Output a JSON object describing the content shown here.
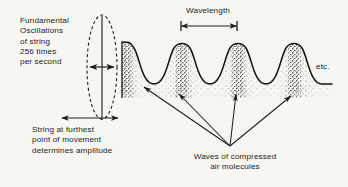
{
  "figure": {
    "background_color": "#f7f6f0",
    "ink_color": "#1d1d1b",
    "width": 348,
    "height": 187
  },
  "labels": {
    "fundamental": "Fundamental\nOscillations\nof string\n256 times\nper second",
    "amplitude": "String at furthest\npoint of movement\ndetermines amplitude",
    "wavelength": "Wavelength",
    "waves": "Waves of compressed\nair molecules",
    "etc": "etc."
  },
  "diagram": {
    "string_ellipse": {
      "name": "vibrating-string-envelope",
      "center_x": 102,
      "center_y": 67,
      "radius_x": 15,
      "radius_y": 52,
      "stroke_dash": "3,2.6"
    },
    "string_line": {
      "name": "string-rest-position",
      "x": 102,
      "y_top": 16,
      "y_bottom": 120
    },
    "amplitude_arrow": {
      "name": "amplitude-double-arrow",
      "x_start": 90,
      "x_end": 114,
      "y": 67
    },
    "wavelength_arrow": {
      "name": "wavelength-double-arrow",
      "x_start": 181,
      "x_end": 237,
      "y": 26,
      "cap_half_height": 5
    },
    "wave": {
      "name": "compression-wave-curve",
      "baseline_y": 84,
      "peak_y": 42,
      "x_start": 122,
      "x_end": 330,
      "wavelength_px": 56,
      "peak_count": 4,
      "peak_centers": [
        126,
        182,
        238,
        294
      ]
    },
    "stipple_bands": [
      {
        "x": 126,
        "density": "high"
      },
      {
        "x": 182,
        "density": "high"
      },
      {
        "x": 238,
        "density": "high"
      },
      {
        "x": 294,
        "density": "high"
      }
    ],
    "pointer_arrows": {
      "name": "pointer-arrows-to-compressions",
      "origin_x": 230,
      "origin_y": 147,
      "tips": [
        {
          "x": 143,
          "y": 86
        },
        {
          "x": 178,
          "y": 93
        },
        {
          "x": 236,
          "y": 93
        },
        {
          "x": 292,
          "y": 95
        }
      ]
    }
  }
}
